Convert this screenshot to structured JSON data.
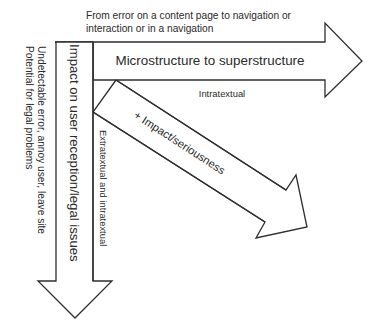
{
  "diagram": {
    "top_note": {
      "line1": "From error on a content page to navigation or",
      "line2": "interaction or in a navigation"
    },
    "horizontal_arrow": {
      "label": "Microstructure to superstructure",
      "sublabel": "Intratextual"
    },
    "vertical_arrow": {
      "label": "Impact on user reception/legal issues",
      "sublabel": "Extratextual and intratextual"
    },
    "diagonal_arrow": {
      "label": "+ Impact/seriousness"
    },
    "side_note": {
      "line1": "Undetectable error, annoy user, leave site",
      "line2": "Potential for legal problems"
    },
    "colors": {
      "stroke": "#2e2e2e",
      "text": "#2a2a2a",
      "background": "#ffffff"
    }
  }
}
